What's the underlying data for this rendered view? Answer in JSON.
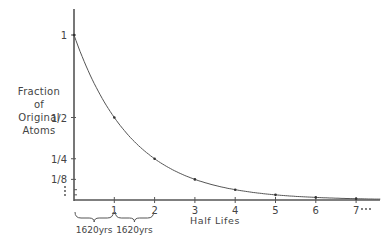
{
  "chart_data": {
    "type": "line",
    "title": "",
    "xlabel": "Half Lifes",
    "ylabel": "Fraction of Original Atoms",
    "ylabel_lines": [
      "Fraction",
      "of",
      "Original",
      "Atoms"
    ],
    "x": [
      0,
      1,
      2,
      3,
      4,
      5,
      6,
      7
    ],
    "series": [
      {
        "name": "Fraction of Original Atoms",
        "values": [
          1,
          0.5,
          0.25,
          0.125,
          0.0625,
          0.03125,
          0.015625,
          0.0078125
        ]
      }
    ],
    "x_tick_labels": [
      "1",
      "2",
      "3",
      "4",
      "5",
      "6",
      "7"
    ],
    "x_continuation": "…",
    "y_ticks": [
      {
        "value": 1,
        "label": "1"
      },
      {
        "value": 0.5,
        "label": "1/2"
      },
      {
        "value": 0.25,
        "label": "1/4"
      },
      {
        "value": 0.125,
        "label": "1/8"
      }
    ],
    "y_minor_ticks": [
      0.0625,
      0.03125
    ],
    "y_continuation": "⋮",
    "annotations": [
      {
        "type": "brace",
        "from": 0,
        "to": 1,
        "label": "1620yrs"
      },
      {
        "type": "brace",
        "from": 1,
        "to": 2,
        "label": "1620yrs"
      }
    ],
    "xlim": [
      0,
      7.6
    ],
    "ylim": [
      0,
      1.15
    ],
    "grid": false,
    "legend": "none"
  }
}
